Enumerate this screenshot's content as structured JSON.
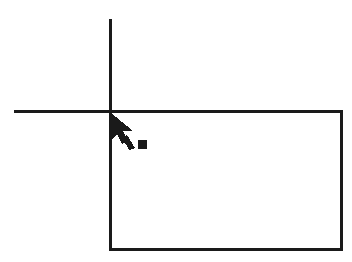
{
  "canvas": {
    "width": 352,
    "height": 262,
    "background_color": "#ffffff",
    "ink_color": "#1a1a1a",
    "title": "Rectangle drawing with crosshair reference and pointer"
  },
  "figure": {
    "type": "line-drawing",
    "elements": [
      {
        "name": "vertical-reference-line",
        "kind": "line",
        "x1": 110,
        "y1": 19,
        "x2": 110,
        "y2": 111,
        "stroke_width": 3,
        "color": "#1a1a1a"
      },
      {
        "name": "horizontal-reference-line",
        "kind": "line",
        "x1": 14,
        "y1": 111,
        "x2": 110,
        "y2": 111,
        "stroke_width": 3,
        "color": "#1a1a1a"
      },
      {
        "name": "rectangle-shape",
        "kind": "rect",
        "x": 110,
        "y": 111,
        "width": 231,
        "height": 138,
        "stroke_width": 3,
        "fill": "none",
        "color": "#1a1a1a"
      },
      {
        "name": "mouse-pointer-cursor",
        "kind": "cursor",
        "hotspot_x": 110,
        "hotspot_y": 112,
        "color": "#1a1a1a"
      },
      {
        "name": "square-marker",
        "kind": "square",
        "x": 138,
        "y": 140,
        "size": 9,
        "fill": "#1a1a1a"
      }
    ]
  },
  "geometry": {
    "intersection_point": {
      "x": 110,
      "y": 111
    },
    "rectangle_bounds": {
      "left": 110,
      "top": 111,
      "right": 341,
      "bottom": 249
    },
    "rectangle_size": {
      "width": 231,
      "height": 138
    }
  }
}
